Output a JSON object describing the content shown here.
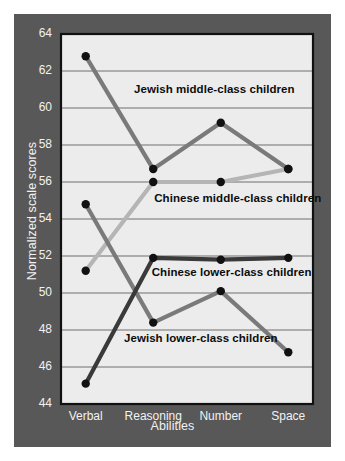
{
  "figure": {
    "background_color": "#ffffff",
    "panel_color": "#585858",
    "plot_background_color": "#ececec",
    "plot_border_color": "#111111",
    "gridline_color": "#6e6e6e",
    "tick_text_color": "#f2f2f2",
    "series_label_color": "#0d0d0d"
  },
  "chart_data": {
    "type": "line",
    "title": "",
    "xlabel": "Abilities",
    "ylabel": "Normalized scale scores",
    "categories": [
      "Verbal",
      "Reasoning",
      "Number",
      "Space"
    ],
    "ylim": [
      44,
      64
    ],
    "yticks": [
      44,
      46,
      48,
      50,
      52,
      54,
      56,
      58,
      60,
      62,
      64
    ],
    "grid": true,
    "legend_position": "inline-annotations",
    "marker": "filled-circle",
    "marker_color": "#111111",
    "series": [
      {
        "name": "Jewish middle-class children",
        "values": [
          62.8,
          56.7,
          59.2,
          56.7
        ],
        "color": "#7a7a7a",
        "label_x_pct": 29,
        "label_y_value": 61.0
      },
      {
        "name": "Chinese middle-class children",
        "values": [
          51.2,
          56.0,
          56.0,
          56.7
        ],
        "color": "#b5b5b5",
        "label_x_pct": 37,
        "label_y_value": 55.1
      },
      {
        "name": "Chinese lower-class children",
        "values": [
          45.1,
          51.9,
          51.8,
          51.9
        ],
        "color": "#3a3a3a",
        "label_x_pct": 36,
        "label_y_value": 51.1
      },
      {
        "name": "Jewish lower-class children",
        "values": [
          54.8,
          48.4,
          50.1,
          46.8
        ],
        "color": "#7a7a7a",
        "label_x_pct": 25,
        "label_y_value": 47.5
      }
    ]
  },
  "ticks": {
    "y": [
      "64",
      "62",
      "60",
      "58",
      "56",
      "54",
      "52",
      "50",
      "48",
      "46",
      "44"
    ],
    "x": [
      "Verbal",
      "Reasoning",
      "Number",
      "Space"
    ]
  },
  "labels": {
    "y_axis_title": "Normalized scale scores",
    "x_axis_title": "Abilities",
    "jewish_middle": "Jewish middle-class children",
    "chinese_middle": "Chinese middle-class children",
    "chinese_lower": "Chinese lower-class children",
    "jewish_lower": "Jewish lower-class children"
  }
}
